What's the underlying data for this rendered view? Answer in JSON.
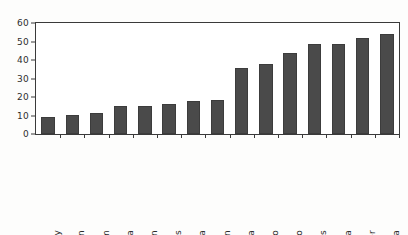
{
  "chart_data": {
    "type": "bar",
    "title": "",
    "xlabel": "",
    "ylabel": "",
    "ylim": [
      0,
      60
    ],
    "ytick_labels": [
      "60",
      "50",
      "40",
      "30",
      "20",
      "10",
      "0"
    ],
    "ytick_values": [
      60,
      50,
      40,
      30,
      20,
      10,
      0
    ],
    "grid": false,
    "legend": "none",
    "bar_color": "#4a4a4a",
    "axis_color": "#3a3a3a",
    "background": "#ffffff",
    "categories": [
      "West Germany",
      "Sweden",
      "United Kingdom",
      "Canada",
      "Japan",
      "United States",
      "China",
      "Soviet Union",
      "Indonesia",
      "Mexico",
      "Morocco",
      "Honduras",
      "Nicaragua",
      "Niger",
      "Kenya"
    ],
    "values": [
      9,
      10.5,
      11.5,
      15,
      15,
      16,
      18,
      18.5,
      35.5,
      38,
      44,
      48.5,
      48.5,
      52,
      54
    ]
  }
}
